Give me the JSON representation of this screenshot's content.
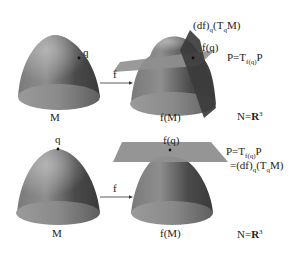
{
  "figure": {
    "colors": {
      "surface_dark": "#3a3a3a",
      "surface_mid": "#6f6f6f",
      "surface_light": "#9a9a9a",
      "plane": "#8f8f8f",
      "plane_dark": "#3c3c3c",
      "text": "#222222",
      "background": "#ffffff"
    }
  },
  "top_panel": {
    "domain_label": "M",
    "point_label": "q",
    "map_label": "f",
    "image_label": "f(M)",
    "image_point_label": "f(q)",
    "tangent_image_label": {
      "pre": "(df)",
      "sub1": "q",
      "mid": "(T",
      "sub2": "q",
      "post": "M)"
    },
    "plane_label": {
      "pre": "P=T",
      "sub": "f(q)",
      "post": "P"
    },
    "codomain_label": {
      "pre": "N=",
      "bold": "R",
      "sup": "3"
    }
  },
  "bottom_panel": {
    "domain_label": "M",
    "point_label": "q",
    "map_label": "f",
    "image_label": "f(M)",
    "image_point_label": "f(q)",
    "plane_label": {
      "pre": "P=T",
      "sub": "f(q)",
      "post": "P"
    },
    "equality_label": {
      "pre": "=(df)",
      "sub1": "q",
      "mid": "(T",
      "sub2": "q",
      "post": "M)"
    },
    "codomain_label": {
      "pre": "N=",
      "bold": "R",
      "sup": "3"
    }
  }
}
